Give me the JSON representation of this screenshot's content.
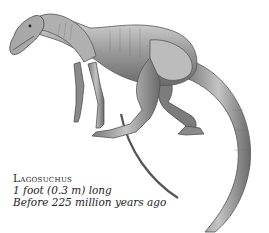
{
  "figure": {
    "caption": {
      "name": "Lagosuchus",
      "size": "1 foot (0.3 m) long",
      "era": "Before 225 million years ago"
    }
  },
  "colors": {
    "background": "#ffffff",
    "ink": "#222222",
    "shade_dark": "#555555",
    "shade_mid": "#8a8a8a",
    "shade_light": "#c8c8c8"
  }
}
